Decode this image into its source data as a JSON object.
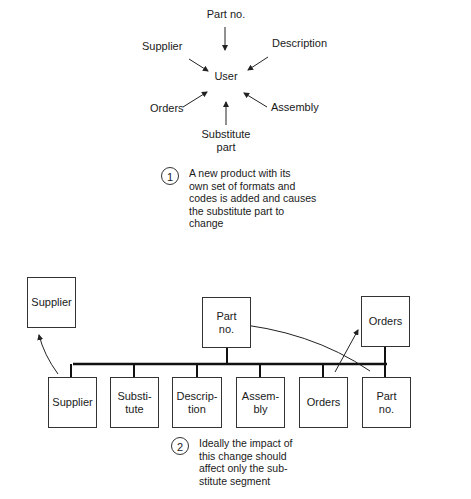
{
  "figure1": {
    "center": "User",
    "inputs": {
      "top": "Part no.",
      "upper_left": "Supplier",
      "upper_right": "Description",
      "lower_left": "Orders",
      "lower_right": "Assembly",
      "bottom": "Substitute part"
    },
    "note_number": "1",
    "note": [
      "A new product with its",
      "own set of formats and",
      "codes is added and causes",
      "the substitute part to",
      "change"
    ]
  },
  "figure2": {
    "root": "Part no.",
    "children": [
      "Supplier",
      "Substi-\ntute",
      "Descrip-\ntion",
      "Assem-\nbly",
      "Orders",
      "Part\nno."
    ],
    "detached_left": "Supplier",
    "detached_right": "Orders",
    "note_number": "2",
    "note": [
      "Ideally the impact of",
      "this change should",
      "affect only the sub-",
      "stitute segment"
    ]
  }
}
